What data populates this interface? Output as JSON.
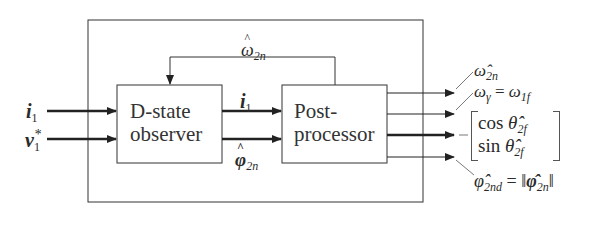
{
  "diagram": {
    "blocks": [
      {
        "id": "observer",
        "line1": "D-state",
        "line2": "observer"
      },
      {
        "id": "postprocessor",
        "line1": "Post-",
        "line2": "processor"
      }
    ],
    "inputs": [
      {
        "symbol": "i",
        "sub": "1",
        "bold": true
      },
      {
        "symbol": "v",
        "sub": "1",
        "sup": "*",
        "bold": true
      }
    ],
    "internal_signals": {
      "feedback": {
        "symbol": "ω",
        "sub": "2n",
        "hat": true
      },
      "current": {
        "symbol": "i",
        "sub": "1",
        "bold": true
      },
      "flux": {
        "symbol": "φ",
        "sub": "2n",
        "hat": true,
        "bold": true
      }
    },
    "outputs": [
      {
        "label": "ω̂",
        "sub": "2n"
      },
      {
        "lhs": "ω",
        "lhs_sub": "γ",
        "eq": "=",
        "rhs": "ω",
        "rhs_sub": "1f"
      },
      {
        "row1_fn": "cos",
        "row1_var": "θ̂",
        "row1_sub": "2f",
        "row2_fn": "sin",
        "row2_var": "θ̂",
        "row2_sub": "2f"
      },
      {
        "lhs": "φ̂",
        "lhs_sub": "2nd",
        "eq": "=",
        "rhs_open": "‖",
        "rhs": "φ̂",
        "rhs_sub": "2n",
        "rhs_close": "‖"
      }
    ]
  }
}
